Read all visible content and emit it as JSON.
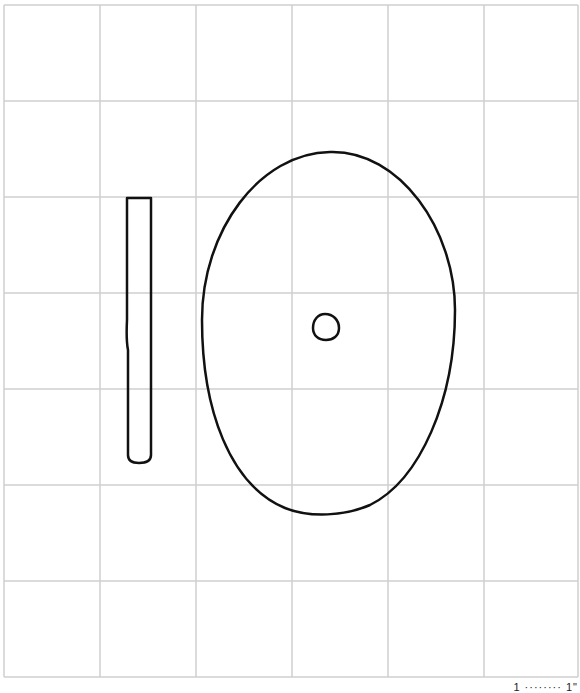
{
  "diagram": {
    "background": "#ffffff",
    "grid": {
      "color": "#cfcfcf",
      "x_lines": [
        4,
        100,
        196,
        292,
        388,
        484,
        578
      ],
      "y_lines": [
        5,
        101,
        197,
        293,
        389,
        485,
        581,
        677
      ]
    },
    "shapes": [
      {
        "type": "rod",
        "label": "narrow vertical rod with rounded bottom",
        "stroke": "#111111"
      },
      {
        "type": "ellipse",
        "label": "large oval outline",
        "stroke": "#111111"
      },
      {
        "type": "small-circle",
        "label": "small circle at oval center",
        "stroke": "#111111"
      }
    ],
    "footer": "1 ········ 1\""
  }
}
